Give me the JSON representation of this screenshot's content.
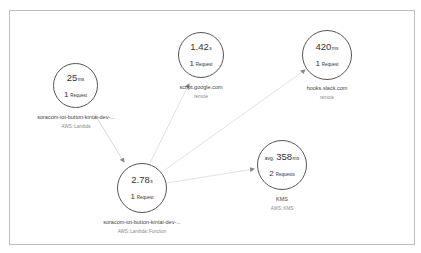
{
  "diagram": {
    "type": "service-map",
    "frame_border_color": "#bdbdbd",
    "edge_color": "#d8d8d8",
    "node_border_color": "#555555",
    "nodes": [
      {
        "id": "lambda",
        "metric_prefix": "",
        "metric_value": "25",
        "metric_unit": "ms",
        "request_count": "1",
        "request_word": "Request",
        "name": "soracom-iot-button-kintai-dev-...",
        "type": "AWS::Lambda"
      },
      {
        "id": "google",
        "metric_prefix": "",
        "metric_value": "1.42",
        "metric_unit": "s",
        "request_count": "1",
        "request_word": "Request",
        "name": "script.google.com",
        "type": "remote"
      },
      {
        "id": "slack",
        "metric_prefix": "",
        "metric_value": "420",
        "metric_unit": "ms",
        "request_count": "1",
        "request_word": "Request",
        "name": "hooks.slack.com",
        "type": "remote"
      },
      {
        "id": "function",
        "metric_prefix": "",
        "metric_value": "2.78",
        "metric_unit": "s",
        "request_count": "1",
        "request_word": "Request",
        "name": "soracom-iot-button-kintai-dev-...",
        "type": "AWS::Lambda::Function"
      },
      {
        "id": "kms",
        "metric_prefix": "avg.",
        "metric_value": "358",
        "metric_unit": "ms",
        "request_count": "2",
        "request_word": "Requests",
        "name": "KMS",
        "type": "AWS::KMS"
      }
    ],
    "edges": [
      {
        "from": "lambda",
        "to": "function"
      },
      {
        "from": "function",
        "to": "google"
      },
      {
        "from": "function",
        "to": "slack"
      },
      {
        "from": "function",
        "to": "kms"
      }
    ]
  }
}
